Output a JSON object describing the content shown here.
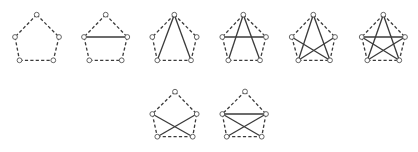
{
  "diagram": {
    "colors": {
      "edge": "#3a3a3a",
      "vertex_stroke": "#555555",
      "vertex_fill": "#ffffff",
      "background": "#ffffff"
    },
    "vertex_radius": 2.4,
    "vertex_order": [
      "top",
      "left",
      "right",
      "bottom_left",
      "bottom_right"
    ],
    "outline_edges": [
      [
        "top",
        "left"
      ],
      [
        "top",
        "right"
      ],
      [
        "left",
        "bottom_left"
      ],
      [
        "right",
        "bottom_right"
      ],
      [
        "bottom_left",
        "bottom_right"
      ]
    ],
    "graphs": [
      {
        "id": "g1",
        "vertices": {
          "top": [
            36.7,
            14.7
          ],
          "left": [
            15,
            37
          ],
          "right": [
            59,
            37
          ],
          "bottom_left": [
            19.5,
            60.3
          ],
          "bottom_right": [
            53.3,
            60.3
          ]
        },
        "solid_edges": []
      },
      {
        "id": "g2",
        "vertices": {
          "top": [
            105.7,
            14.7
          ],
          "left": [
            84,
            37
          ],
          "right": [
            127.3,
            37
          ],
          "bottom_left": [
            89.3,
            60.3
          ],
          "bottom_right": [
            121.7,
            60.3
          ]
        },
        "solid_edges": [
          [
            "left",
            "right"
          ]
        ]
      },
      {
        "id": "g3",
        "vertices": {
          "top": [
            174.3,
            14.7
          ],
          "left": [
            152.3,
            37
          ],
          "right": [
            196.7,
            37
          ],
          "bottom_left": [
            157.3,
            60.3
          ],
          "bottom_right": [
            191,
            60.3
          ]
        },
        "solid_edges": [
          [
            "top",
            "bottom_left"
          ],
          [
            "top",
            "bottom_right"
          ]
        ]
      },
      {
        "id": "g4",
        "vertices": {
          "top": [
            243.3,
            14.7
          ],
          "left": [
            222.3,
            37
          ],
          "right": [
            266,
            37
          ],
          "bottom_left": [
            228.3,
            60.3
          ],
          "bottom_right": [
            260,
            60.3
          ]
        },
        "solid_edges": [
          [
            "top",
            "bottom_left"
          ],
          [
            "top",
            "bottom_right"
          ],
          [
            "left",
            "right"
          ]
        ]
      },
      {
        "id": "g5",
        "vertices": {
          "top": [
            313.3,
            14.7
          ],
          "left": [
            291.7,
            37
          ],
          "right": [
            335,
            37
          ],
          "bottom_left": [
            298.3,
            60.3
          ],
          "bottom_right": [
            330,
            60.3
          ]
        },
        "solid_edges": [
          [
            "top",
            "bottom_left"
          ],
          [
            "top",
            "bottom_right"
          ],
          [
            "left",
            "bottom_right"
          ],
          [
            "right",
            "bottom_left"
          ]
        ]
      },
      {
        "id": "g6",
        "vertices": {
          "top": [
            383.3,
            14.7
          ],
          "left": [
            361.7,
            37
          ],
          "right": [
            405,
            37
          ],
          "bottom_left": [
            367.3,
            60.3
          ],
          "bottom_right": [
            399.3,
            60.3
          ]
        },
        "solid_edges": [
          [
            "top",
            "bottom_left"
          ],
          [
            "top",
            "bottom_right"
          ],
          [
            "left",
            "bottom_right"
          ],
          [
            "right",
            "bottom_left"
          ],
          [
            "left",
            "right"
          ]
        ]
      },
      {
        "id": "g7",
        "vertices": {
          "top": [
            175,
            91.7
          ],
          "left": [
            152.3,
            114
          ],
          "right": [
            196.7,
            114
          ],
          "bottom_left": [
            157.3,
            136.7
          ],
          "bottom_right": [
            192.7,
            136.7
          ]
        },
        "solid_edges": [
          [
            "left",
            "bottom_right"
          ],
          [
            "right",
            "bottom_left"
          ]
        ]
      },
      {
        "id": "g8",
        "vertices": {
          "top": [
            245,
            91.5
          ],
          "left": [
            222.3,
            114
          ],
          "right": [
            266,
            114
          ],
          "bottom_left": [
            226.7,
            136.7
          ],
          "bottom_right": [
            261.7,
            136.7
          ]
        },
        "solid_edges": [
          [
            "left",
            "right"
          ],
          [
            "left",
            "bottom_right"
          ],
          [
            "right",
            "bottom_left"
          ]
        ]
      }
    ]
  }
}
